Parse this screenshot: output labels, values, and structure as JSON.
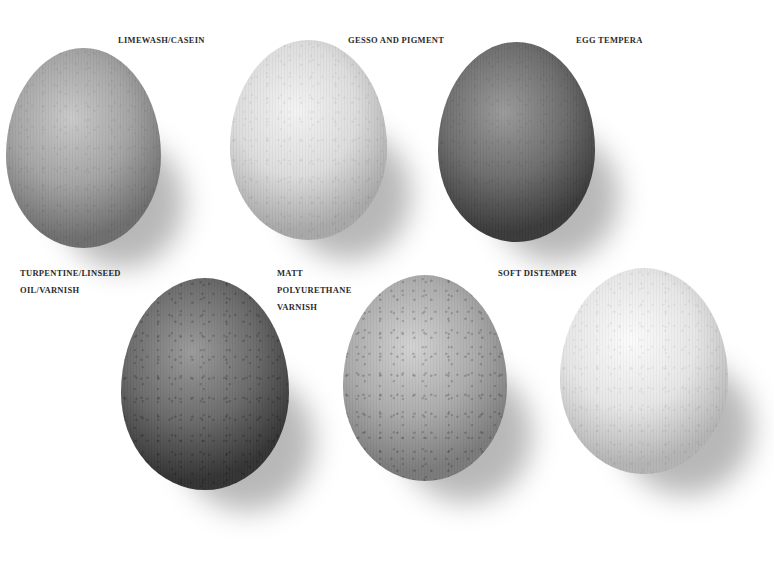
{
  "samples": [
    {
      "label_lines": [
        "LIMEWASH/CASEIN"
      ],
      "tone": {
        "light": "#c9c9c9",
        "mid": "#a3a3a3",
        "dark": "#6e6e6e"
      },
      "speckled": false
    },
    {
      "label_lines": [
        "GESSO AND PIGMENT"
      ],
      "tone": {
        "light": "#f3f3f3",
        "mid": "#dcdcdc",
        "dark": "#a8a8a8"
      },
      "speckled": false
    },
    {
      "label_lines": [
        "EGG TEMPERA"
      ],
      "tone": {
        "light": "#9a9a9a",
        "mid": "#6d6d6d",
        "dark": "#3a3a3a"
      },
      "speckled": false
    },
    {
      "label_lines": [
        "TURPENTINE/LINSEED",
        "OIL/VARNISH"
      ],
      "tone": {
        "light": "#9b9b9b",
        "mid": "#6a6a6a",
        "dark": "#333333"
      },
      "speckled": true
    },
    {
      "label_lines": [
        "MATT",
        "POLYURETHANE",
        "VARNISH"
      ],
      "tone": {
        "light": "#d2d2d2",
        "mid": "#ababab",
        "dark": "#7a7a7a"
      },
      "speckled": true
    },
    {
      "label_lines": [
        "SOFT DISTEMPER"
      ],
      "tone": {
        "light": "#fbfbfb",
        "mid": "#e6e6e6",
        "dark": "#b4b4b4"
      },
      "speckled": false
    }
  ]
}
